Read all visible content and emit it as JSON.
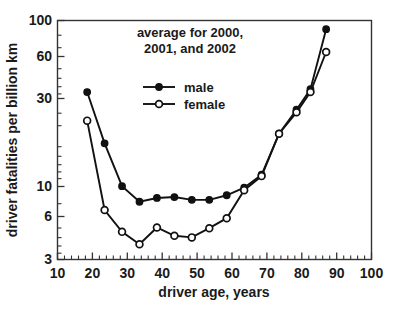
{
  "chart_data": {
    "type": "line",
    "title_line1": "average for 2000,",
    "title_line2": "2001, and 2002",
    "xlabel": "driver age, years",
    "ylabel": "driver fatalities per billion km",
    "xscale": "linear",
    "yscale": "log",
    "xlim": [
      10,
      100
    ],
    "ylim": [
      3,
      100
    ],
    "xticks": [
      10,
      20,
      30,
      40,
      50,
      60,
      70,
      80,
      90,
      100
    ],
    "xtick_labels": [
      "10",
      "20",
      "30",
      "40",
      "50",
      "60",
      "70",
      "80",
      "90",
      "100"
    ],
    "yticks": [
      3,
      6,
      10,
      30,
      60,
      100
    ],
    "ytick_labels": [
      "3",
      "6",
      "10",
      "30",
      "60",
      "100"
    ],
    "grid": false,
    "legend_position": "upper center",
    "x": [
      18.5,
      23.5,
      28.5,
      33.5,
      38.5,
      43.5,
      48.5,
      53.5,
      58.5,
      63.5,
      68.5,
      73.5,
      78.5,
      82.5,
      87
    ],
    "series": [
      {
        "name": "male",
        "marker": "filled-circle",
        "color": "#111111",
        "values": [
          35,
          16.5,
          8.8,
          7.0,
          7.4,
          7.5,
          7.2,
          7.2,
          7.7,
          8.6,
          10.4,
          19.0,
          27.0,
          36.5,
          88
        ]
      },
      {
        "name": "female",
        "marker": "open-circle",
        "color": "#111111",
        "values": [
          23,
          6.2,
          4.5,
          3.75,
          4.8,
          4.25,
          4.15,
          4.75,
          5.5,
          8.3,
          10.2,
          19.0,
          26.0,
          35.0,
          63
        ]
      }
    ],
    "legend": [
      {
        "label": "male",
        "marker": "filled-circle"
      },
      {
        "label": "female",
        "marker": "open-circle"
      }
    ]
  }
}
